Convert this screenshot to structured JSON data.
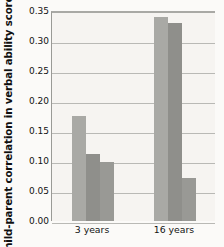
{
  "chart_data": {
    "type": "bar",
    "title": "",
    "subtitle": "",
    "xlabel": "",
    "ylabel": "Child-parent correlation in verbal ability scores",
    "categories": [
      "3 years",
      "16 years"
    ],
    "series": [
      {
        "name": "series-1",
        "values": [
          0.175,
          0.34
        ],
        "color": "#a9a9a5"
      },
      {
        "name": "series-2",
        "values": [
          0.112,
          0.33
        ],
        "color": "#8f8f8b"
      },
      {
        "name": "series-3",
        "values": [
          0.098,
          0.071
        ],
        "color": "#999995"
      }
    ],
    "ylim": [
      0.0,
      0.35
    ],
    "ytick_values": [
      0.0,
      0.05,
      0.1,
      0.15,
      0.2,
      0.25,
      0.3,
      0.35
    ],
    "ytick_labels": [
      "0.00",
      "0.05",
      "0.10",
      "0.15",
      "0.20",
      "0.25",
      "0.30",
      "0.35"
    ],
    "grid": true,
    "grid_axis": "y",
    "legend": false,
    "legend_position": "none",
    "plot_background": "#f6f4f1",
    "grid_color": "#b9b9b5",
    "axis_color": "#9a9a96",
    "text_color": "#121212"
  }
}
